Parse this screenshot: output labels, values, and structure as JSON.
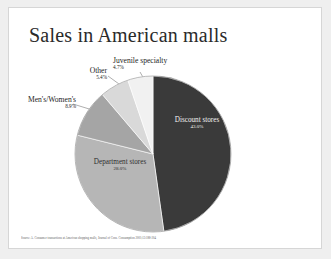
{
  "slide": {
    "title": "Sales in American malls",
    "footer": "Source: A. Consumer transactions at American shopping malls, Journal of Cons. Consumption 2001;13:188-204"
  },
  "chart_data": {
    "type": "pie",
    "title": "Sales in American malls",
    "categories": [
      "Discount stores",
      "Department stores",
      "Men's/Women's",
      "Other",
      "Juvenile specialty"
    ],
    "values": [
      43.0,
      28.0,
      8.9,
      5.4,
      4.7
    ],
    "value_labels": [
      "43.0%",
      "28.0%",
      "8.9%",
      "5.4%",
      "4.7%"
    ],
    "colors": [
      "#3a3a3a",
      "#b6b6b6",
      "#a5a5a5",
      "#d9d9d9",
      "#f1f1f1"
    ],
    "start_angle_deg": 0,
    "direction": "clockwise",
    "legend": "none",
    "grid": false,
    "labels": [
      {
        "name": "Discount stores",
        "pct": "43.0%",
        "placement": "inside"
      },
      {
        "name": "Department stores",
        "pct": "28.0%",
        "placement": "inside"
      },
      {
        "name": "Men's/Women's",
        "pct": "8.9%",
        "placement": "outside-left"
      },
      {
        "name": "Other",
        "pct": "5.4%",
        "placement": "outside-top-left"
      },
      {
        "name": "Juvenile specialty",
        "pct": "4.7%",
        "placement": "outside-top"
      }
    ]
  }
}
